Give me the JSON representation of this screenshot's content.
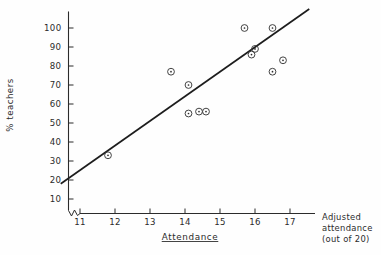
{
  "chart_data": {
    "type": "scatter",
    "title": "",
    "xlabel": "Attendance",
    "ylabel": "% teachers",
    "x_axis_note_line1": "Adjusted",
    "x_axis_note_line2": "attendance",
    "x_axis_note_line3": "(out of 20)",
    "xlim": [
      10.4,
      17.6
    ],
    "ylim": [
      0,
      107
    ],
    "grid": false,
    "legend": null,
    "axis_break": true,
    "x_ticks": [
      11,
      12,
      13,
      14,
      15,
      16,
      17
    ],
    "x_tick_labels": [
      "11",
      "12",
      "13",
      "14",
      "15",
      "16",
      "17"
    ],
    "y_ticks": [
      10,
      20,
      30,
      40,
      50,
      60,
      70,
      80,
      90,
      100
    ],
    "y_tick_labels": [
      "10",
      "20",
      "30",
      "40",
      "50",
      "60",
      "70",
      "80",
      "90",
      "100"
    ],
    "points": [
      {
        "x": 11.8,
        "y": 33
      },
      {
        "x": 13.6,
        "y": 77
      },
      {
        "x": 14.1,
        "y": 70
      },
      {
        "x": 14.1,
        "y": 55
      },
      {
        "x": 14.4,
        "y": 56
      },
      {
        "x": 14.6,
        "y": 56
      },
      {
        "x": 15.7,
        "y": 100
      },
      {
        "x": 15.9,
        "y": 86
      },
      {
        "x": 16.0,
        "y": 89
      },
      {
        "x": 16.5,
        "y": 100
      },
      {
        "x": 16.5,
        "y": 77
      },
      {
        "x": 16.8,
        "y": 83
      }
    ],
    "series": [
      {
        "name": "observations",
        "marker": "circle-with-center-dot",
        "values": [
          33,
          77,
          70,
          55,
          56,
          56,
          100,
          86,
          89,
          100,
          77,
          83
        ]
      }
    ],
    "trend_line": {
      "type": "linear-fit",
      "x_start": 10.45,
      "y_start": 18,
      "x_end": 17.55,
      "y_end": 110,
      "color": "#1d1d1d"
    },
    "colors": {
      "axis": "#2b2b2b",
      "marker": "#3a3a3a",
      "trend": "#1d1d1d",
      "background": "#fefefe"
    }
  }
}
